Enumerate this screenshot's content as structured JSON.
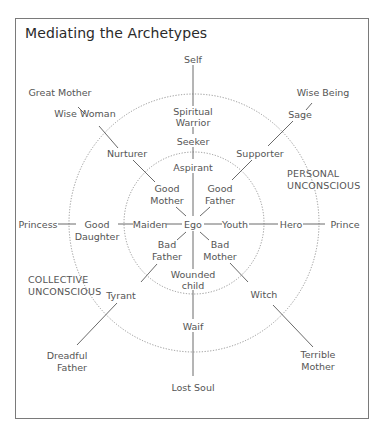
{
  "title": "Mediating the Archetypes",
  "colors": {
    "text": "#555555",
    "line": "#6a6a6a",
    "frame": "#7a7a7a",
    "title": "#2a2a2a"
  },
  "center": "Ego",
  "rings": [
    {
      "name": "inner",
      "label": ""
    },
    {
      "name": "outer",
      "label": "PERSONAL UNCONSCIOUS"
    }
  ],
  "zones": {
    "personal": [
      "PERSONAL",
      "UNCONSCIOUS"
    ],
    "collective": [
      "COLLECTIVE",
      "UNCONSCIOUS"
    ]
  },
  "axes": [
    {
      "direction": "up",
      "labels": [
        "Aspirant",
        "Seeker",
        "Spiritual Warrior",
        "Self"
      ]
    },
    {
      "direction": "down",
      "labels": [
        "Wounded child",
        "Waif",
        "Lost Soul"
      ]
    },
    {
      "direction": "left",
      "labels": [
        "Maiden",
        "Good Daughter",
        "Princess"
      ]
    },
    {
      "direction": "right",
      "labels": [
        "Youth",
        "Hero",
        "Prince"
      ]
    },
    {
      "direction": "up-left",
      "labels": [
        "Good Mother",
        "Nurturer",
        "Wise Woman",
        "Great Mother"
      ]
    },
    {
      "direction": "up-right",
      "labels": [
        "Good Father",
        "Supporter",
        "Sage",
        "Wise Being"
      ]
    },
    {
      "direction": "down-left",
      "labels": [
        "Bad Father",
        "Tyrant",
        "Dreadful Father"
      ]
    },
    {
      "direction": "down-right",
      "labels": [
        "Bad Mother",
        "Witch",
        "Terrible Mother"
      ]
    }
  ],
  "labels": {
    "ego": "Ego",
    "aspirant": "Aspirant",
    "seeker": "Seeker",
    "spiritual_1": "Spiritual",
    "spiritual_2": "Warrior",
    "self": "Self",
    "wounded_1": "Wounded",
    "wounded_2": "child",
    "waif": "Waif",
    "lost_soul": "Lost Soul",
    "maiden": "Maiden",
    "good_daughter_1": "Good",
    "good_daughter_2": "Daughter",
    "princess": "Princess",
    "youth": "Youth",
    "hero": "Hero",
    "prince": "Prince",
    "good_mother_1": "Good",
    "good_mother_2": "Mother",
    "nurturer": "Nurturer",
    "wise_woman": "Wise Woman",
    "great_mother": "Great Mother",
    "good_father_1": "Good",
    "good_father_2": "Father",
    "supporter": "Supporter",
    "sage": "Sage",
    "wise_being": "Wise Being",
    "bad_father_1": "Bad",
    "bad_father_2": "Father",
    "tyrant": "Tyrant",
    "dreadful_1": "Dreadful",
    "dreadful_2": "Father",
    "bad_mother_1": "Bad",
    "bad_mother_2": "Mother",
    "witch": "Witch",
    "terrible_1": "Terrible",
    "terrible_2": "Mother",
    "personal_1": "PERSONAL",
    "personal_2": "UNCONSCIOUS",
    "collective_1": "COLLECTIVE",
    "collective_2": "UNCONSCIOUS"
  }
}
